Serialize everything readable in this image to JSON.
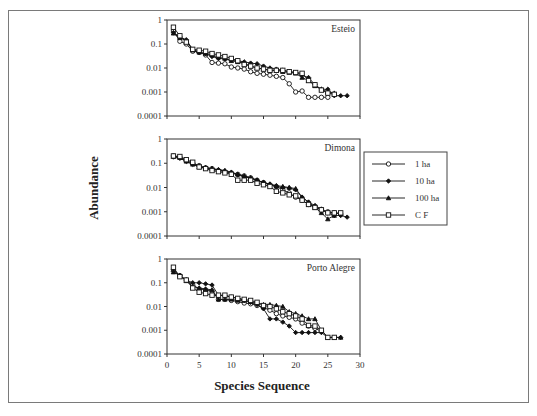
{
  "figure": {
    "ylabel": "Abundance",
    "xlabel": "Species Sequence",
    "yticks": [
      "1",
      "0.1",
      "0.01",
      "0.001",
      "0.0001"
    ],
    "xticks": [
      "0",
      "5",
      "10",
      "15",
      "20",
      "25",
      "30"
    ]
  },
  "legend": {
    "items": [
      {
        "label": "1 ha",
        "marker": "circle-open"
      },
      {
        "label": "10 ha",
        "marker": "diamond-filled"
      },
      {
        "label": "100 ha",
        "marker": "triangle-filled"
      },
      {
        "label": "C F",
        "marker": "square-open"
      }
    ]
  },
  "chart_data": [
    {
      "type": "line",
      "title": "Esteio",
      "xlabel": "Species Sequence",
      "ylabel": "Abundance",
      "yscale": "log",
      "ylim": [
        0.0001,
        1
      ],
      "xlim": [
        0,
        30
      ],
      "series": [
        {
          "name": "1 ha",
          "x": [
            1,
            2,
            3,
            4,
            5,
            6,
            7,
            8,
            9,
            10,
            11,
            12,
            13,
            14,
            15,
            16,
            17,
            18,
            19,
            20,
            21,
            22,
            23,
            24,
            25
          ],
          "values": [
            0.35,
            0.13,
            0.1,
            0.05,
            0.045,
            0.035,
            0.017,
            0.016,
            0.015,
            0.011,
            0.01,
            0.009,
            0.007,
            0.006,
            0.0055,
            0.005,
            0.0045,
            0.004,
            0.0022,
            0.001,
            0.0011,
            0.0006,
            0.0006,
            0.0006,
            0.0006
          ]
        },
        {
          "name": "10 ha",
          "x": [
            1,
            2,
            3,
            4,
            5,
            6,
            7,
            8,
            9,
            10,
            11,
            12,
            13,
            14,
            15,
            16,
            17,
            18,
            19,
            20,
            21,
            22,
            23,
            24,
            25,
            26,
            27,
            28
          ],
          "values": [
            0.3,
            0.2,
            0.15,
            0.06,
            0.045,
            0.04,
            0.03,
            0.025,
            0.024,
            0.022,
            0.02,
            0.018,
            0.016,
            0.015,
            0.012,
            0.01,
            0.009,
            0.008,
            0.007,
            0.0065,
            0.005,
            0.004,
            0.002,
            0.0013,
            0.0013,
            0.0007,
            0.0007,
            0.0007
          ]
        },
        {
          "name": "100 ha",
          "x": [
            1,
            2,
            3,
            4,
            5,
            6,
            7,
            8,
            9,
            10,
            11,
            12,
            13,
            14,
            15,
            16,
            17,
            18,
            19,
            20,
            21,
            22,
            23,
            24,
            25,
            26
          ],
          "values": [
            0.28,
            0.18,
            0.14,
            0.055,
            0.045,
            0.04,
            0.035,
            0.028,
            0.025,
            0.02,
            0.018,
            0.016,
            0.012,
            0.01,
            0.009,
            0.008,
            0.008,
            0.007,
            0.0065,
            0.006,
            0.004,
            0.003,
            0.0018,
            0.0013,
            0.001,
            0.0009
          ]
        },
        {
          "name": "C F",
          "x": [
            1,
            2,
            3,
            4,
            5,
            6,
            7,
            8,
            9,
            10,
            11,
            12,
            13,
            14,
            15,
            16,
            17,
            18,
            19,
            20,
            21,
            22,
            23,
            24,
            25,
            26
          ],
          "values": [
            0.5,
            0.22,
            0.12,
            0.06,
            0.055,
            0.05,
            0.04,
            0.035,
            0.03,
            0.025,
            0.02,
            0.014,
            0.012,
            0.01,
            0.009,
            0.008,
            0.008,
            0.008,
            0.007,
            0.0065,
            0.006,
            0.003,
            0.002,
            0.0012,
            0.0009,
            0.0008
          ]
        }
      ]
    },
    {
      "type": "line",
      "title": "Dimona",
      "xlabel": "Species Sequence",
      "ylabel": "Abundance",
      "yscale": "log",
      "ylim": [
        0.0001,
        1
      ],
      "xlim": [
        0,
        30
      ],
      "series": [
        {
          "name": "1 ha",
          "x": [
            1,
            2,
            3,
            4,
            5,
            6,
            7,
            8,
            9,
            10,
            11,
            12,
            13,
            14,
            15,
            16,
            17,
            18,
            19,
            20,
            21,
            22,
            23,
            24,
            25,
            26,
            27
          ],
          "values": [
            0.2,
            0.18,
            0.13,
            0.1,
            0.08,
            0.065,
            0.06,
            0.05,
            0.045,
            0.04,
            0.035,
            0.03,
            0.025,
            0.02,
            0.016,
            0.013,
            0.011,
            0.008,
            0.006,
            0.004,
            0.003,
            0.002,
            0.0016,
            0.0012,
            0.001,
            0.0009,
            0.0008
          ]
        },
        {
          "name": "10 ha",
          "x": [
            1,
            2,
            3,
            4,
            5,
            6,
            7,
            8,
            9,
            10,
            11,
            12,
            13,
            14,
            15,
            16,
            17,
            18,
            19,
            20,
            21,
            22,
            23,
            24,
            25,
            26,
            27,
            28
          ],
          "values": [
            0.18,
            0.16,
            0.12,
            0.09,
            0.075,
            0.065,
            0.058,
            0.052,
            0.048,
            0.04,
            0.033,
            0.028,
            0.024,
            0.02,
            0.016,
            0.013,
            0.011,
            0.01,
            0.0095,
            0.008,
            0.004,
            0.0025,
            0.0018,
            0.0013,
            0.0009,
            0.0007,
            0.0007,
            0.0006
          ]
        },
        {
          "name": "100 ha",
          "x": [
            1,
            2,
            3,
            4,
            5,
            6,
            7,
            8,
            9,
            10,
            11,
            12,
            13,
            14,
            15,
            16,
            17,
            18,
            19,
            20,
            21,
            22,
            23,
            24,
            25,
            26
          ],
          "values": [
            0.19,
            0.17,
            0.12,
            0.09,
            0.07,
            0.065,
            0.06,
            0.055,
            0.05,
            0.043,
            0.035,
            0.03,
            0.025,
            0.02,
            0.016,
            0.014,
            0.012,
            0.011,
            0.01,
            0.009,
            0.004,
            0.0025,
            0.0015,
            0.0009,
            0.0005,
            0.0007
          ]
        },
        {
          "name": "C F",
          "x": [
            1,
            2,
            3,
            4,
            5,
            6,
            7,
            8,
            9,
            10,
            11,
            12,
            13,
            14,
            15,
            16,
            17,
            18,
            19,
            20,
            21,
            22,
            23,
            24,
            25,
            26,
            27
          ],
          "values": [
            0.2,
            0.19,
            0.14,
            0.11,
            0.07,
            0.06,
            0.05,
            0.045,
            0.04,
            0.035,
            0.02,
            0.02,
            0.02,
            0.015,
            0.013,
            0.011,
            0.007,
            0.006,
            0.005,
            0.0045,
            0.003,
            0.002,
            0.0015,
            0.0012,
            0.0009,
            0.0009,
            0.0009
          ]
        }
      ]
    },
    {
      "type": "line",
      "title": "Porto Alegre",
      "xlabel": "Species Sequence",
      "ylabel": "Abundance",
      "yscale": "log",
      "ylim": [
        0.0001,
        1
      ],
      "xlim": [
        0,
        30
      ],
      "series": [
        {
          "name": "1 ha",
          "x": [
            1,
            2,
            3,
            4,
            5,
            6,
            7,
            8,
            9,
            10,
            11,
            12,
            13,
            14,
            15,
            16,
            17,
            18,
            19,
            20,
            21,
            22,
            23,
            24
          ],
          "values": [
            0.35,
            0.2,
            0.13,
            0.08,
            0.055,
            0.05,
            0.045,
            0.02,
            0.02,
            0.018,
            0.016,
            0.014,
            0.013,
            0.011,
            0.009,
            0.007,
            0.005,
            0.004,
            0.0035,
            0.003,
            0.002,
            0.0015,
            0.0012,
            0.0009
          ]
        },
        {
          "name": "10 ha",
          "x": [
            1,
            2,
            3,
            4,
            5,
            6,
            7,
            8,
            9,
            10,
            11,
            12,
            13,
            14,
            15,
            16,
            17,
            18,
            19,
            20,
            21,
            22,
            23,
            24,
            25,
            26,
            27
          ],
          "values": [
            0.3,
            0.2,
            0.13,
            0.1,
            0.1,
            0.09,
            0.08,
            0.03,
            0.028,
            0.025,
            0.022,
            0.018,
            0.015,
            0.012,
            0.008,
            0.003,
            0.003,
            0.0022,
            0.0015,
            0.0008,
            0.0008,
            0.0008,
            0.0008,
            0.0008,
            0.0005,
            0.0005,
            0.0005
          ]
        },
        {
          "name": "100 ha",
          "x": [
            1,
            2,
            3,
            4,
            5,
            6,
            7,
            8,
            9,
            10,
            11,
            12,
            13,
            14,
            15,
            16,
            17,
            18,
            19,
            20,
            21,
            22,
            23,
            24,
            25,
            26,
            27
          ],
          "values": [
            0.28,
            0.2,
            0.12,
            0.07,
            0.06,
            0.055,
            0.05,
            0.02,
            0.02,
            0.02,
            0.018,
            0.018,
            0.016,
            0.014,
            0.012,
            0.012,
            0.011,
            0.01,
            0.006,
            0.005,
            0.004,
            0.003,
            0.003,
            0.001,
            0.0005,
            0.0005,
            0.0005
          ]
        },
        {
          "name": "C F",
          "x": [
            1,
            2,
            3,
            4,
            5,
            6,
            7,
            8,
            9,
            10,
            11,
            12,
            13,
            14,
            15,
            16,
            17,
            18,
            19,
            20,
            21,
            22,
            23,
            24,
            25,
            26
          ],
          "values": [
            0.45,
            0.18,
            0.13,
            0.06,
            0.04,
            0.035,
            0.03,
            0.03,
            0.03,
            0.025,
            0.022,
            0.02,
            0.018,
            0.015,
            0.011,
            0.01,
            0.008,
            0.006,
            0.005,
            0.004,
            0.003,
            0.0016,
            0.0015,
            0.001,
            0.0005,
            0.0005
          ]
        }
      ]
    }
  ]
}
